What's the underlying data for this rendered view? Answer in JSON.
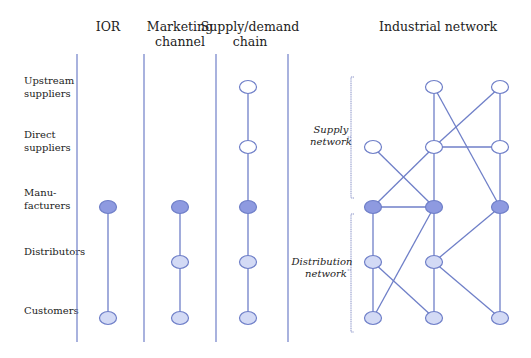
{
  "headers": {
    "ior": [
      "IOR"
    ],
    "marketing": [
      "Marketing",
      "channel"
    ],
    "supply_demand": [
      "Supply/demand",
      "chain"
    ],
    "industrial": [
      "Industrial network"
    ]
  },
  "row_labels": [
    {
      "key": "upstream",
      "lines": [
        "Upstream",
        "suppliers"
      ]
    },
    {
      "key": "direct",
      "lines": [
        "Direct",
        "suppliers"
      ]
    },
    {
      "key": "mfg",
      "lines": [
        "Manu-",
        "facturers"
      ]
    },
    {
      "key": "dist",
      "lines": [
        "Distributors"
      ]
    },
    {
      "key": "cust",
      "lines": [
        "Customers"
      ]
    }
  ],
  "network_labels": {
    "supply": [
      "Supply",
      "network"
    ],
    "distribution": [
      "Distribution",
      "network"
    ]
  },
  "colors": {
    "line": "#6f7fc8",
    "node_stroke": "#6f7fc8",
    "supplier_fill": "#ffffff",
    "manufacturer_fill": "#8e9ae0",
    "downstream_fill": "#d3daf5"
  },
  "columns": {
    "ior": {
      "nodes": [
        {
          "row": "mfg",
          "type": "manufacturer"
        },
        {
          "row": "cust",
          "type": "downstream"
        }
      ],
      "edges": [
        [
          "mfg",
          "cust"
        ]
      ]
    },
    "marketing": {
      "nodes": [
        {
          "row": "mfg",
          "type": "manufacturer"
        },
        {
          "row": "dist",
          "type": "downstream"
        },
        {
          "row": "cust",
          "type": "downstream"
        }
      ],
      "edges": [
        [
          "mfg",
          "dist"
        ],
        [
          "dist",
          "cust"
        ]
      ]
    },
    "supply_demand": {
      "nodes": [
        {
          "row": "upstream",
          "type": "supplier"
        },
        {
          "row": "direct",
          "type": "supplier"
        },
        {
          "row": "mfg",
          "type": "manufacturer"
        },
        {
          "row": "dist",
          "type": "downstream"
        },
        {
          "row": "cust",
          "type": "downstream"
        }
      ],
      "edges": [
        [
          "upstream",
          "direct"
        ],
        [
          "direct",
          "mfg"
        ],
        [
          "mfg",
          "dist"
        ],
        [
          "dist",
          "cust"
        ]
      ]
    }
  },
  "industrial_network": {
    "nodes": [
      {
        "id": "u2",
        "row": "upstream",
        "col": 2,
        "type": "supplier"
      },
      {
        "id": "u3",
        "row": "upstream",
        "col": 3,
        "type": "supplier"
      },
      {
        "id": "d1",
        "row": "direct",
        "col": 1,
        "type": "supplier"
      },
      {
        "id": "d2",
        "row": "direct",
        "col": 2,
        "type": "supplier"
      },
      {
        "id": "d3",
        "row": "direct",
        "col": 3,
        "type": "supplier"
      },
      {
        "id": "m1",
        "row": "mfg",
        "col": 1,
        "type": "manufacturer"
      },
      {
        "id": "m2",
        "row": "mfg",
        "col": 2,
        "type": "manufacturer"
      },
      {
        "id": "m3",
        "row": "mfg",
        "col": 3,
        "type": "manufacturer"
      },
      {
        "id": "t1",
        "row": "dist",
        "col": 1,
        "type": "downstream"
      },
      {
        "id": "t2",
        "row": "dist",
        "col": 2,
        "type": "downstream"
      },
      {
        "id": "c1",
        "row": "cust",
        "col": 1,
        "type": "downstream"
      },
      {
        "id": "c2",
        "row": "cust",
        "col": 2,
        "type": "downstream"
      },
      {
        "id": "c3",
        "row": "cust",
        "col": 3,
        "type": "downstream"
      }
    ],
    "edges": [
      [
        "u2",
        "d2"
      ],
      [
        "u2",
        "m3"
      ],
      [
        "u3",
        "d2"
      ],
      [
        "u3",
        "d3"
      ],
      [
        "d1",
        "m2"
      ],
      [
        "d2",
        "d3"
      ],
      [
        "d2",
        "m1"
      ],
      [
        "d2",
        "m2"
      ],
      [
        "d3",
        "m3"
      ],
      [
        "m1",
        "m2"
      ],
      [
        "m1",
        "t1"
      ],
      [
        "m2",
        "t2"
      ],
      [
        "m2",
        "c1"
      ],
      [
        "m3",
        "t2"
      ],
      [
        "m3",
        "c3"
      ],
      [
        "t1",
        "c1"
      ],
      [
        "t1",
        "c2"
      ],
      [
        "t2",
        "c2"
      ],
      [
        "t2",
        "c3"
      ]
    ]
  }
}
